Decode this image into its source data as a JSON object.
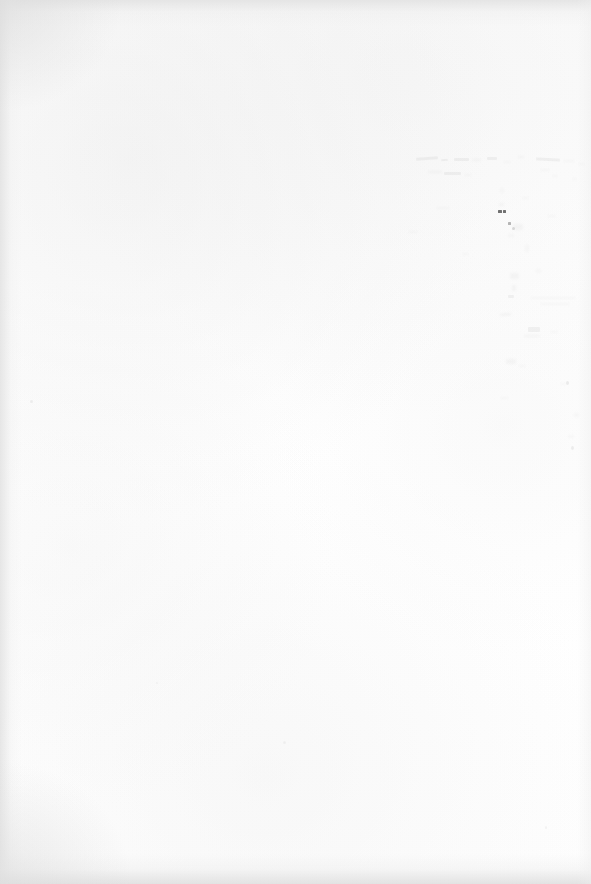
{
  "page": {
    "kind": "scanned-document-page",
    "orientation": "portrait",
    "width_px": 591,
    "height_px": 884,
    "visible_text": "",
    "legible_content": "none",
    "description": "Blank scanned paper page with faint show-through ghost marks in the upper-right quadrant and soft scanner vignette along the top, left and bottom edges.",
    "colors": {
      "paper_base": "#fdfdfd",
      "paper_shade": "#f7f7f7",
      "edge_vignette": "#e2e2e2",
      "ghost_mark": "#b9b9b9",
      "ink_speck": "#4a4a4a"
    }
  },
  "artifacts": {
    "ghost_cluster": {
      "label": "show-through ghost marks",
      "region": {
        "x": 410,
        "y": 150,
        "width": 170,
        "height": 300
      },
      "legible": false,
      "note": "Bleed-through from the reverse or adjacent page; blob shapes resembling words and handwriting, no readable characters."
    },
    "ink_specks": {
      "label": "ink specks",
      "count": 2,
      "positions": [
        {
          "x": 500,
          "y": 212
        },
        {
          "x": 508,
          "y": 222
        }
      ]
    },
    "edge_shadows": {
      "label": "scanner edge shadow",
      "edges": [
        "top",
        "left",
        "bottom"
      ]
    }
  }
}
